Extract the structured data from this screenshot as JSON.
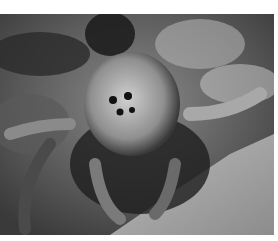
{
  "image": {
    "subject": "spider close-up",
    "tone": "grayscale",
    "colors": {
      "background": "#ffffff",
      "dark": "#1e1e1e",
      "mid": "#6a6a6a",
      "light": "#d8d8d8"
    }
  }
}
